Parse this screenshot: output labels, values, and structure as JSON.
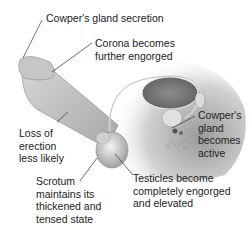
{
  "figure": {
    "type": "anatomical-illustration",
    "colors": {
      "background": "#ffffff",
      "shading_light": "#e8e8e8",
      "shading_mid": "#bdbdbd",
      "shading_dark": "#8a8a8a",
      "leader_line": "#333333",
      "text": "#222222"
    }
  },
  "labels": [
    {
      "id": "cowpers-secretion",
      "text": "Cowper's gland secretion"
    },
    {
      "id": "corona",
      "text": "Corona becomes\nfurther engorged"
    },
    {
      "id": "cowpers-gland",
      "text": "Cowper's\ngland\nbecomes\nactive"
    },
    {
      "id": "loss-of-erection",
      "text": "Loss of\nerection\nless likely"
    },
    {
      "id": "scrotum",
      "text": "Scrotum\nmaintains its\nthickened and\ntensed state"
    },
    {
      "id": "testicles",
      "text": "Testicles become\ncompletely engorged\nand elevated"
    }
  ]
}
